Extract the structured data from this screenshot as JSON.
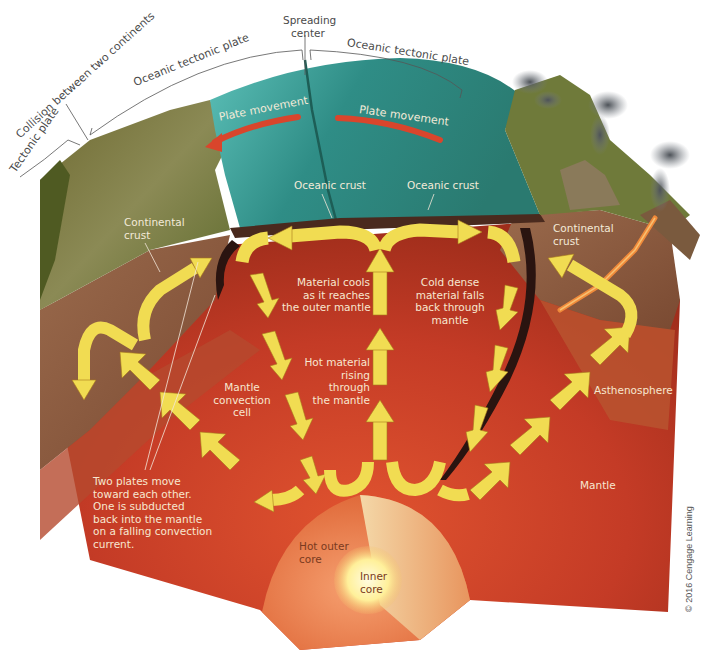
{
  "diagram": {
    "type": "cutaway earth block diagram",
    "colors": {
      "ocean_plate": "#2f8a84",
      "ocean_plate_light": "#55b8b0",
      "continental_surface": "#7f7a3a",
      "continental_crust": "#8a5a3e",
      "mantle": "#c8402a",
      "mantle_dark": "#a8301e",
      "asthenosphere": "#b5532f",
      "outer_core": "#e8794a",
      "inner_core": "#fff3a0",
      "convection_arrow": "#f1dc52",
      "plate_arrow": "#d9452c",
      "magma": "#f08a3a",
      "smoke": "#555a60"
    }
  },
  "top_labels": {
    "tectonic_plate": "Tectonic plate",
    "collision": "Collision between two continents",
    "oceanic_plate_left": "Oceanic tectonic plate",
    "spreading_center_line1": "Spreading",
    "spreading_center_line2": "center",
    "oceanic_plate_right": "Oceanic tectonic plate"
  },
  "surface_labels": {
    "plate_movement_left": "Plate movement",
    "plate_movement_right": "Plate movement",
    "oceanic_crust_left": "Oceanic crust",
    "oceanic_crust_right": "Oceanic crust",
    "continental_crust_left_1": "Continental",
    "continental_crust_left_2": "crust",
    "continental_crust_right_1": "Continental",
    "continental_crust_right_2": "crust"
  },
  "interior_labels": {
    "material_cools": [
      "Material cools",
      "as it reaches",
      "the outer mantle"
    ],
    "cold_dense": [
      "Cold dense",
      "material falls",
      "back through",
      "mantle"
    ],
    "hot_rising": [
      "Hot material",
      "rising",
      "through",
      "the mantle"
    ],
    "convection_cell": [
      "Mantle",
      "convection",
      "cell"
    ],
    "asthenosphere": "Asthenosphere",
    "mantle": "Mantle",
    "subduction_note": [
      "Two plates move",
      "toward each other.",
      "One is subducted",
      "back into the mantle",
      "on a falling convection",
      "current."
    ],
    "outer_core": [
      "Hot outer",
      "core"
    ],
    "inner_core": [
      "Inner",
      "core"
    ]
  },
  "credit": "© 2016 Cengage Learning"
}
